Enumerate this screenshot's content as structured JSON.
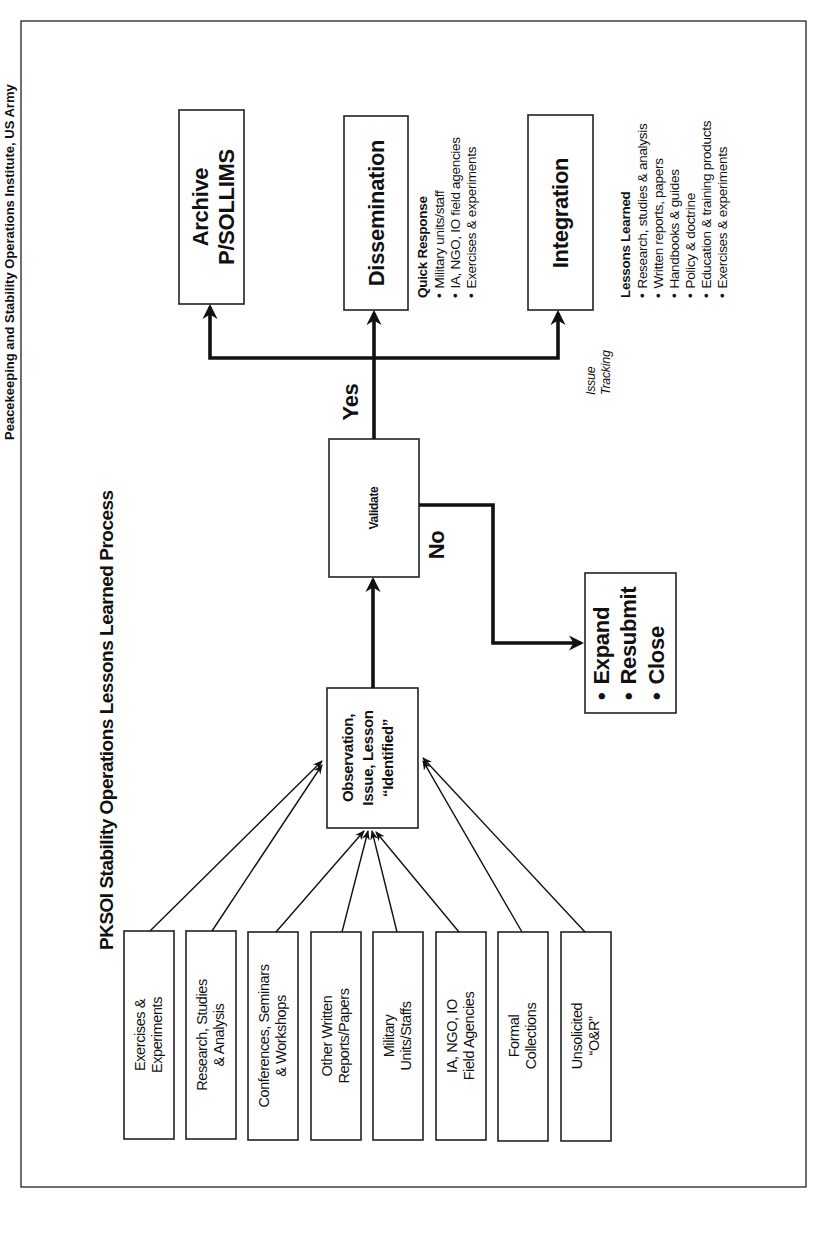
{
  "header": {
    "partial_caption": "Peacekeeping and Stability Operations Institute, US Army"
  },
  "diagram": {
    "title": "PKSOI Stability Operations Lessons Learned Process",
    "sources": [
      {
        "line1": "Exercises &",
        "line2": "Experiments"
      },
      {
        "line1": "Research, Studies",
        "line2": "& Analysis"
      },
      {
        "line1": "Conferences, Seminars",
        "line2": "& Workshops"
      },
      {
        "line1": "Other Written",
        "line2": "Reports/Papers"
      },
      {
        "line1": "Military",
        "line2": "Units/Staffs"
      },
      {
        "line1": "IA, NGO, IO",
        "line2": "Field Agencies"
      },
      {
        "line1": "Formal",
        "line2": "Collections"
      },
      {
        "line1": "Unsolicited",
        "line2": "“O&R”"
      }
    ],
    "observation": {
      "line1": "Observation,",
      "line2": "Issue, Lesson",
      "line3": "“Identified”"
    },
    "validate": {
      "label": "Validate"
    },
    "yes_label": "Yes",
    "no_label": "No",
    "reject_box": {
      "items": [
        "Expand",
        "Resubmit",
        "Close"
      ],
      "bullet": "•"
    },
    "outputs": {
      "archive": {
        "line1": "Archive",
        "line2": "P/SOLLIMS"
      },
      "dissemination": {
        "label": "Dissemination"
      },
      "integration": {
        "label": "Integration"
      }
    },
    "issue_tracking": {
      "line1": "Issue",
      "line2": "Tracking"
    },
    "quick_response": {
      "heading": "Quick Response",
      "items": [
        "Military units/staff",
        "IA, NGO, IO field agencies",
        "Exercises & experiments"
      ]
    },
    "lessons_learned": {
      "heading": "Lessons Learned",
      "items": [
        "Research, studies & analysis",
        "Written reports, papers",
        "Handbooks & guides",
        "Policy & doctrine",
        "Education & training products",
        "Exercises & experiments"
      ]
    },
    "colors": {
      "ink": "#111111",
      "background": "#ffffff",
      "frame": "#333333"
    }
  }
}
